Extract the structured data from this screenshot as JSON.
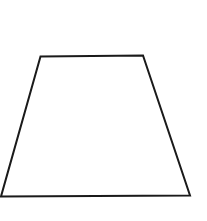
{
  "diagram": {
    "shape": "trapezoid",
    "stroke_color": "#1a1a1a",
    "fill_color": "#ffffff",
    "background_color": "#ffffff",
    "stroke_width": 2,
    "vertices": [
      {
        "name": "top-left",
        "x": 40.5,
        "y": 56.5
      },
      {
        "name": "top-right",
        "x": 143,
        "y": 55.5
      },
      {
        "name": "bottom-right",
        "x": 190,
        "y": 195.5
      },
      {
        "name": "bottom-left",
        "x": 1,
        "y": 196.5
      }
    ],
    "points": "40.5,56.5 143,55.5 190,195.5 1,196.5"
  }
}
